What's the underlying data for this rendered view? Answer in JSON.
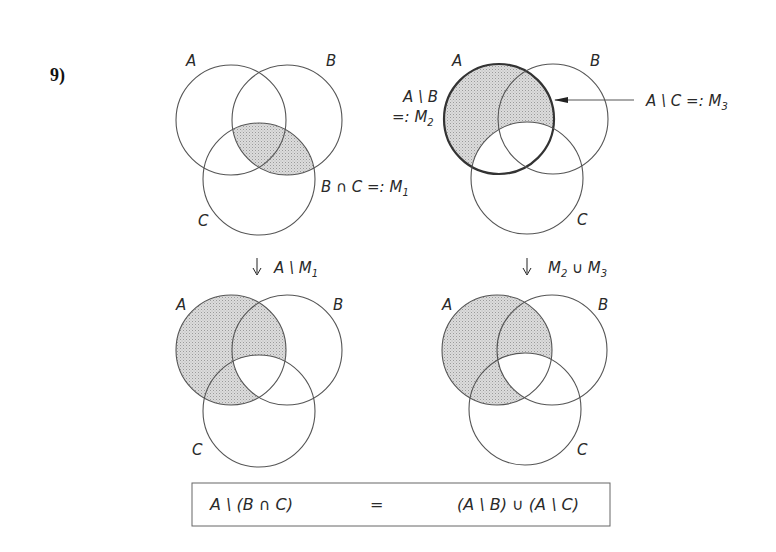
{
  "problem_number": "9)",
  "diagrams": [
    {
      "id": "top-left",
      "labels": {
        "a": "A",
        "b": "B",
        "c": "C"
      },
      "annotation": "B ∩ C =: M",
      "annotation_sub": "1",
      "shaded_region": "B ∩ C"
    },
    {
      "id": "top-right",
      "labels": {
        "a": "A",
        "b": "B",
        "c": "C"
      },
      "annotation_left_1": "A \\ B",
      "annotation_left_2": "=: M",
      "annotation_left_sub": "2",
      "annotation_right": "A \\ C =: M",
      "annotation_right_sub": "3",
      "shaded_region": "A \\ C"
    },
    {
      "id": "bottom-left",
      "labels": {
        "a": "A",
        "b": "B",
        "c": "C"
      },
      "shaded_region": "A \\ M1"
    },
    {
      "id": "bottom-right",
      "labels": {
        "a": "A",
        "b": "B",
        "c": "C"
      },
      "shaded_region": "M2 ∪ M3"
    }
  ],
  "arrows": {
    "left_label": "A \\ M",
    "left_sub": "1",
    "right_label_a": "M",
    "right_sub_a": "2",
    "right_label_b": " ∪ M",
    "right_sub_b": "3"
  },
  "formula": {
    "lhs": "A \\ (B ∩ C)",
    "eq": "=",
    "rhs": "(A \\ B) ∪ (A \\ C)"
  },
  "colors": {
    "shade": "#d2d2d2",
    "stroke": "#555555"
  }
}
